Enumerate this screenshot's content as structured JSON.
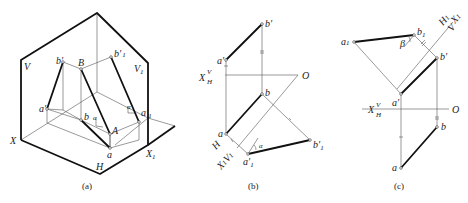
{
  "figure": {
    "panels": [
      {
        "id": "a",
        "caption": "(a)",
        "labels": {
          "V": "V",
          "V1": "V",
          "V1_sub": "1",
          "X": "X",
          "X1": "X",
          "X1_sub": "1",
          "H": "H",
          "b_prime": "b′",
          "B": "B",
          "b1_prime": "b′",
          "b1_prime_sub": "1",
          "a_prime": "a′",
          "b": "b",
          "A": "A",
          "a": "a",
          "a1_prime": "a′",
          "a1_prime_sub": "1",
          "alpha1": "α",
          "alpha2": "α"
        }
      },
      {
        "id": "b",
        "caption": "(b)",
        "labels": {
          "b_prime": "b′",
          "a_prime": "a′",
          "X": "X",
          "V": "V",
          "H": "H",
          "O": "O",
          "b": "b",
          "a": "a",
          "H1": "H",
          "X1V1": "X",
          "X1_sub": "1",
          "V1": "V",
          "V1_sub": "1",
          "a1_prime": "a′",
          "a1_prime_sub": "1",
          "b1_prime": "b′",
          "b1_prime_sub": "1",
          "alpha": "α"
        }
      },
      {
        "id": "c",
        "caption": "(c)",
        "labels": {
          "a1": "a",
          "a1_sub": "1",
          "b1": "b",
          "b1_sub": "1",
          "beta": "β",
          "H1": "H",
          "H1_sub": "1",
          "X1": "X",
          "X1_sub": "1",
          "V": "V",
          "b_prime": "b′",
          "a_prime": "a′",
          "X": "X",
          "Vaxis": "V",
          "Haxis": "H",
          "O": "O",
          "b": "b",
          "a": "a"
        }
      }
    ]
  }
}
